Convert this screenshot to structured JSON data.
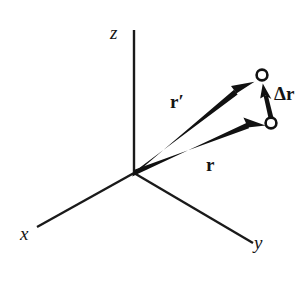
{
  "figure": {
    "background_color": "#ffffff",
    "ink_color": "#111111",
    "width": 307,
    "height": 282
  },
  "axes": {
    "origin": {
      "x": 134,
      "y": 173
    },
    "items": [
      {
        "id": "z",
        "label": "z",
        "from": {
          "x": 134,
          "y": 173
        },
        "to": {
          "x": 134,
          "y": 30
        },
        "label_pos": {
          "x": 110,
          "y": 23
        }
      },
      {
        "id": "x",
        "label": "x",
        "from": {
          "x": 134,
          "y": 173
        },
        "to": {
          "x": 37,
          "y": 227
        },
        "label_pos": {
          "x": 20,
          "y": 224
        }
      },
      {
        "id": "y",
        "label": "y",
        "from": {
          "x": 134,
          "y": 173
        },
        "to": {
          "x": 253,
          "y": 243
        },
        "label_pos": {
          "x": 254,
          "y": 233
        }
      }
    ]
  },
  "vectors": [
    {
      "id": "r-prime",
      "label": "r",
      "prime": "′",
      "full_label": "r′",
      "description": "position vector to upper point",
      "from": {
        "x": 134,
        "y": 173
      },
      "to": {
        "x": 255,
        "y": 82
      },
      "label_pos": {
        "x": 170,
        "y": 92
      },
      "thickness": 5.0
    },
    {
      "id": "r",
      "label": "r",
      "prime": "",
      "full_label": "r",
      "description": "position vector to lower point",
      "from": {
        "x": 134,
        "y": 173
      },
      "to": {
        "x": 266,
        "y": 126
      },
      "label_pos": {
        "x": 206,
        "y": 155
      },
      "thickness": 5.0
    },
    {
      "id": "delta-r",
      "label": "Δr",
      "prime": "",
      "full_label": "Δr",
      "description": "displacement vector from lower point to upper point",
      "from": {
        "x": 271,
        "y": 118
      },
      "to": {
        "x": 263,
        "y": 84
      },
      "label_pos": {
        "x": 274,
        "y": 84
      },
      "thickness": 4.0
    }
  ],
  "points": [
    {
      "id": "point-upper",
      "description": "endpoint of r-prime",
      "center": {
        "x": 262,
        "y": 75
      },
      "radius": 5.4
    },
    {
      "id": "point-lower",
      "description": "endpoint of r",
      "center": {
        "x": 271,
        "y": 123
      },
      "radius": 5.4
    }
  ],
  "labels": {
    "z_axis": "z",
    "x_axis": "x",
    "y_axis": "y",
    "r_prime_base": "r",
    "r_prime_mark": "′",
    "r_base": "r",
    "delta_r": "Δr"
  }
}
